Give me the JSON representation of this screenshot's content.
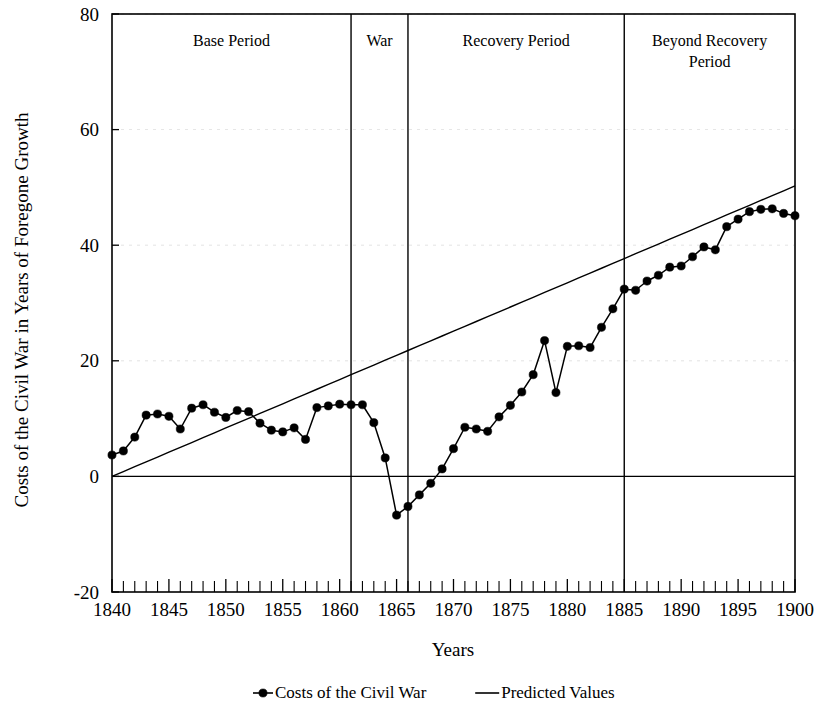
{
  "chart_data": {
    "type": "line",
    "title": "",
    "xlabel": "Years",
    "ylabel": "Costs of the Civil War in Years of Foregone Growth",
    "xlim": [
      1840,
      1900
    ],
    "ylim": [
      -20,
      80
    ],
    "yticks": [
      -20,
      0,
      20,
      40,
      60,
      80
    ],
    "xticks": [
      1840,
      1845,
      1850,
      1855,
      1860,
      1865,
      1870,
      1875,
      1880,
      1885,
      1890,
      1895,
      1900
    ],
    "grid": true,
    "legend_position": "bottom",
    "x": [
      1840,
      1841,
      1842,
      1843,
      1844,
      1845,
      1846,
      1847,
      1848,
      1849,
      1850,
      1851,
      1852,
      1853,
      1854,
      1855,
      1856,
      1857,
      1858,
      1859,
      1860,
      1861,
      1862,
      1863,
      1864,
      1865,
      1866,
      1867,
      1868,
      1869,
      1870,
      1871,
      1872,
      1873,
      1874,
      1875,
      1876,
      1877,
      1878,
      1879,
      1880,
      1881,
      1882,
      1883,
      1884,
      1885,
      1886,
      1887,
      1888,
      1889,
      1890,
      1891,
      1892,
      1893,
      1894,
      1895,
      1896,
      1897,
      1898,
      1899,
      1900
    ],
    "series": [
      {
        "name": "Costs of the Civil War",
        "marker": "filled-circle",
        "values": [
          3.7,
          4.4,
          6.8,
          10.6,
          10.8,
          10.4,
          8.2,
          11.8,
          12.4,
          11.1,
          10.2,
          11.4,
          11.2,
          9.2,
          8.0,
          7.7,
          8.4,
          6.4,
          11.9,
          12.2,
          12.5,
          12.4,
          12.4,
          9.3,
          3.2,
          -6.7,
          -5.2,
          -3.2,
          -1.2,
          1.3,
          4.8,
          8.5,
          8.2,
          7.8,
          10.3,
          12.3,
          14.6,
          17.6,
          23.5,
          14.5,
          22.5,
          22.6,
          22.3,
          25.8,
          29.0,
          32.4,
          32.2,
          33.8,
          34.8,
          36.2,
          36.4,
          38.0,
          39.7,
          39.2,
          43.2,
          44.5,
          45.8,
          46.2,
          46.3,
          45.5,
          45.1
        ]
      },
      {
        "name": "Predicted Values",
        "marker": "none",
        "values": [
          0.0,
          0.84,
          1.68,
          2.51,
          3.35,
          4.19,
          5.03,
          5.86,
          6.7,
          7.54,
          8.38,
          9.21,
          10.05,
          10.89,
          11.73,
          12.56,
          13.4,
          14.24,
          15.08,
          15.91,
          16.75,
          17.59,
          18.43,
          19.26,
          20.1,
          20.94,
          21.78,
          22.61,
          23.45,
          24.29,
          25.13,
          25.96,
          26.8,
          27.64,
          28.48,
          29.31,
          30.15,
          30.99,
          31.83,
          32.66,
          33.5,
          34.34,
          35.18,
          36.01,
          36.85,
          37.69,
          38.53,
          39.36,
          40.2,
          41.04,
          41.88,
          42.71,
          43.55,
          44.39,
          45.23,
          46.06,
          46.9,
          47.74,
          48.58,
          49.41,
          50.25
        ]
      }
    ],
    "period_bands": [
      {
        "label": "Base Period",
        "start": 1840,
        "end": 1861
      },
      {
        "label": "War",
        "start": 1861,
        "end": 1866
      },
      {
        "label": "Recovery Period",
        "start": 1866,
        "end": 1885
      },
      {
        "label": "Beyond Recovery Period",
        "start": 1885,
        "end": 1900
      }
    ],
    "dividers": [
      1861,
      1866,
      1885
    ]
  },
  "legend": {
    "items": [
      {
        "label": "Costs of the Civil War",
        "marker": "line-with-dot"
      },
      {
        "label": "Predicted Values",
        "marker": "line"
      }
    ]
  },
  "axes": {
    "y_title": "Costs of the Civil War in Years of Foregone Growth",
    "x_title": "Years"
  }
}
